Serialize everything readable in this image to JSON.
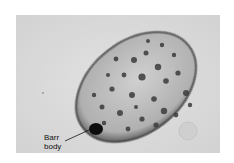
{
  "figure": {
    "type": "micrograph",
    "annotation": {
      "line1": "Barr",
      "line2": "body"
    }
  },
  "colors": {
    "background": "#dcdcdc",
    "nucleus": "#c4c4c4",
    "chromatin": "#3a3a3a",
    "barr_body": "#0a0a0a"
  }
}
